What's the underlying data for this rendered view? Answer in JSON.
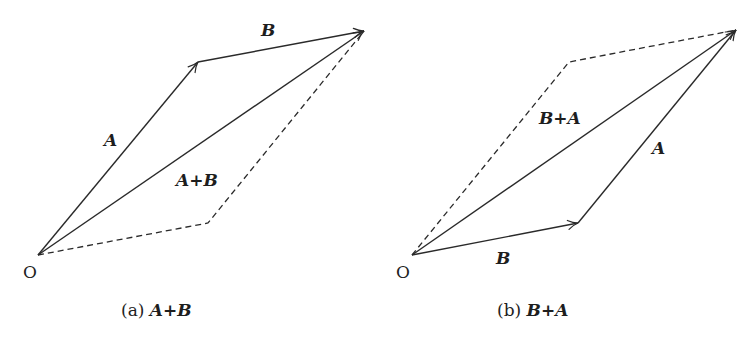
{
  "colors": {
    "background": "#ffffff",
    "stroke": "#2a2a2a",
    "text": "#1e1e1e"
  },
  "panel_a": {
    "caption_prefix": "(a) ",
    "caption_expr": "A+B",
    "origin_label": "O",
    "vector_a_label": "A",
    "vector_b_label": "B",
    "resultant_label": "A+B",
    "points": {
      "origin": [
        38,
        255
      ],
      "a_tip": [
        198,
        62
      ],
      "sum_tip": [
        364,
        31
      ],
      "dashed_corner": [
        208,
        223
      ]
    }
  },
  "panel_b": {
    "caption_prefix": "(b) ",
    "caption_expr": "B+A",
    "origin_label": "O",
    "vector_a_label": "A",
    "vector_b_label": "B",
    "resultant_label": "B+A",
    "points": {
      "origin": [
        412,
        255
      ],
      "b_tip": [
        578,
        223
      ],
      "sum_tip": [
        736,
        30
      ],
      "dashed_corner": [
        569,
        62
      ]
    }
  }
}
